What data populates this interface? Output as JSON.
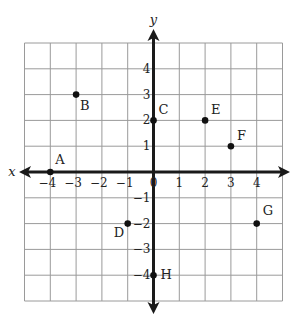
{
  "chart_data": {
    "type": "scatter",
    "title": "",
    "xlabel": "x",
    "ylabel": "y",
    "xlim": [
      -5,
      5
    ],
    "ylim": [
      -5,
      5
    ],
    "grid": true,
    "x_ticks": [
      "-4",
      "-3",
      "-2",
      "-1",
      "0",
      "1",
      "2",
      "3",
      "4"
    ],
    "y_ticks": [
      "4",
      "3",
      "2",
      "1",
      "-1",
      "-2",
      "-3",
      "-4"
    ],
    "points": [
      {
        "label": "A",
        "x": -4,
        "y": 0
      },
      {
        "label": "B",
        "x": -3,
        "y": 3
      },
      {
        "label": "C",
        "x": 0,
        "y": 2
      },
      {
        "label": "D",
        "x": -1,
        "y": -2
      },
      {
        "label": "E",
        "x": 2,
        "y": 2
      },
      {
        "label": "F",
        "x": 3,
        "y": 1
      },
      {
        "label": "G",
        "x": 4,
        "y": -2
      },
      {
        "label": "H",
        "x": 0,
        "y": -4
      }
    ]
  },
  "colors": {
    "grid": "#9a9a9a",
    "axis": "#1a1a1a",
    "point": "#111111"
  }
}
